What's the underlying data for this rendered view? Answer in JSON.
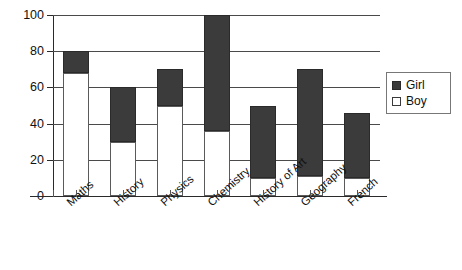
{
  "chart_data": {
    "type": "bar",
    "subtype": "stacked-bar",
    "title": "",
    "xlabel": "",
    "ylabel": "",
    "ylim": [
      0,
      100
    ],
    "yticks": [
      0,
      20,
      40,
      60,
      80,
      100
    ],
    "ytick_labels": [
      "0",
      "20",
      "40",
      "60",
      "80",
      "100"
    ],
    "grid": true,
    "legend_position": "right",
    "categories": [
      "Maths",
      "History",
      "Physics",
      "Chemistry",
      "History of Art",
      "Geography",
      "French"
    ],
    "series": [
      {
        "name": "Boy",
        "color": "#ffffff",
        "values": [
          68,
          30,
          50,
          36,
          10,
          11,
          10
        ]
      },
      {
        "name": "Girl",
        "color": "#3b3b3b",
        "values": [
          12,
          30,
          20,
          64,
          40,
          59,
          36
        ]
      }
    ],
    "totals": [
      80,
      60,
      70,
      100,
      50,
      70,
      46
    ]
  },
  "legend": {
    "items": [
      {
        "label": "Girl",
        "swatch": "filled-dark-square-icon"
      },
      {
        "label": "Boy",
        "swatch": "empty-white-square-icon"
      }
    ]
  }
}
